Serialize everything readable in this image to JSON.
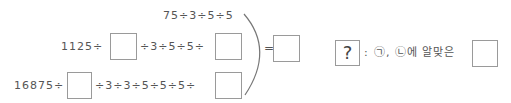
{
  "problem": {
    "row1": {
      "expression": "75÷3÷5÷5"
    },
    "row2": {
      "prefix": "1125÷",
      "middle": "÷3÷5÷5÷",
      "blank_left": "",
      "blank_right": ""
    },
    "row3": {
      "prefix": "16875÷",
      "middle": "÷3÷3÷5÷5÷5÷",
      "blank_left": "",
      "blank_right": ""
    },
    "equals": "=",
    "result_blank": ""
  },
  "legend": {
    "symbol": "?",
    "colon": ":",
    "description": "㉠, ㉡에 알맞은",
    "answer_blank": ""
  },
  "colors": {
    "text": "#555555",
    "box_border": "#9a9a9a",
    "bracket": "#777777"
  }
}
